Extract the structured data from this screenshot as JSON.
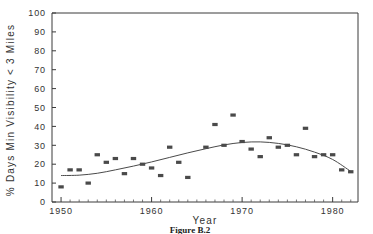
{
  "figure": {
    "caption": "Figure B.2"
  },
  "chart_data": {
    "type": "scatter",
    "title": "",
    "xlabel": "Year",
    "ylabel": "% Days Min Visibility < 3 Miles",
    "xlim": [
      1949,
      1982.8
    ],
    "ylim": [
      0,
      100
    ],
    "grid": false,
    "legend": null,
    "x_ticks": [
      1950,
      1960,
      1970,
      1980
    ],
    "x_tick_labels": [
      "1950",
      "1960",
      "1970",
      "1980"
    ],
    "x_minor_tick_step": 1,
    "y_ticks": [
      0,
      10,
      20,
      30,
      40,
      50,
      60,
      70,
      80,
      90,
      100
    ],
    "y_tick_labels": [
      "0",
      "10",
      "20",
      "30",
      "40",
      "50",
      "60",
      "70",
      "80",
      "90",
      "100"
    ],
    "marker_color": "#4a4a4a",
    "trend_color": "#4a4a4a",
    "x": [
      1950,
      1951,
      1952,
      1953,
      1954,
      1955,
      1956,
      1957,
      1958,
      1959,
      1960,
      1961,
      1962,
      1963,
      1964,
      1966,
      1967,
      1968,
      1969,
      1970,
      1971,
      1972,
      1973,
      1974,
      1975,
      1976,
      1977,
      1978,
      1979,
      1980,
      1981,
      1982
    ],
    "values": [
      8,
      17,
      17,
      10,
      25,
      21,
      23,
      15,
      23,
      20,
      18,
      14,
      29,
      21,
      13,
      29,
      41,
      30,
      46,
      32,
      28,
      24,
      34,
      29,
      30,
      25,
      39,
      24,
      25,
      25,
      17,
      16
    ],
    "trend_line": {
      "name": "smoothed trend",
      "x": [
        1950,
        1952,
        1954,
        1956,
        1958,
        1960,
        1962,
        1964,
        1966,
        1968,
        1970,
        1972,
        1974,
        1976,
        1978,
        1980,
        1982
      ],
      "values": [
        14,
        14.2,
        15.2,
        17,
        19,
        21.2,
        23.6,
        26,
        28.2,
        30.2,
        31.5,
        31.8,
        31,
        29.2,
        26.4,
        22.5,
        16.2
      ]
    }
  }
}
